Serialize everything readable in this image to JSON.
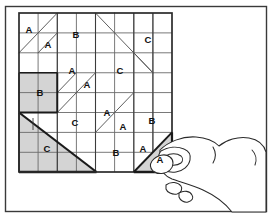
{
  "figure": {
    "frame": {
      "border_color": "#3a3a3a",
      "background": "#ffffff"
    },
    "grid": {
      "columns": 8,
      "rows": 8,
      "x": 19,
      "y": 13,
      "width": 153,
      "height": 159,
      "line_color": "#6a6a6a",
      "border_color": "#2b2b2b"
    },
    "colors": {
      "ink": "#111111",
      "shade": "#d4d4d4",
      "grid_line": "#6a6a6a",
      "heavy_line": "#1a1a1a",
      "paper": "#ffffff",
      "frame": "#3a3a3a"
    },
    "pieces": [
      {
        "id": "piece-a-1",
        "label": "A",
        "x": 29,
        "y": 29
      },
      {
        "id": "piece-a-2",
        "label": "A",
        "x": 48,
        "y": 44
      },
      {
        "id": "piece-b-1",
        "label": "B",
        "x": 76,
        "y": 34
      },
      {
        "id": "piece-c-1",
        "label": "C",
        "x": 148,
        "y": 39
      },
      {
        "id": "piece-b-2",
        "label": "B",
        "x": 42,
        "y": 76
      },
      {
        "id": "piece-a-3",
        "label": "A",
        "x": 72,
        "y": 70
      },
      {
        "id": "piece-a-4",
        "label": "A",
        "x": 86,
        "y": 84
      },
      {
        "id": "piece-c-2",
        "label": "C",
        "x": 119,
        "y": 70
      },
      {
        "id": "piece-a-5",
        "label": "A",
        "x": 109,
        "y": 112
      },
      {
        "id": "piece-c-3",
        "label": "C",
        "x": 76,
        "y": 122
      },
      {
        "id": "piece-a-6",
        "label": "A",
        "x": 124,
        "y": 124
      },
      {
        "id": "piece-b-3",
        "label": "B",
        "x": 153,
        "y": 119
      },
      {
        "id": "piece-c-4",
        "label": "C",
        "x": 48,
        "y": 148
      },
      {
        "id": "piece-b-4",
        "label": "B",
        "x": 119,
        "y": 152
      },
      {
        "id": "piece-a-7",
        "label": "A",
        "x": 143,
        "y": 148
      },
      {
        "id": "piece-a-held",
        "label": "A",
        "x": 161,
        "y": 158
      }
    ],
    "shaded_shapes": [
      {
        "id": "shaded-square-b",
        "kind": "square",
        "label": "B"
      },
      {
        "id": "shaded-triangle-c",
        "kind": "triangle",
        "label": "C"
      },
      {
        "id": "shaded-triangle-a-held",
        "kind": "triangle",
        "label": "A"
      }
    ],
    "hand": {
      "id": "hand",
      "description": "hand holding triangle piece"
    }
  }
}
